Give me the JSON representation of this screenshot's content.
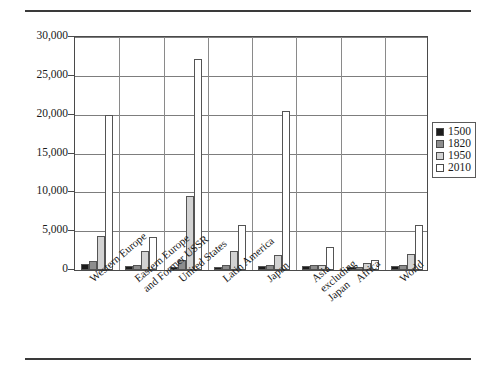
{
  "chart_data": {
    "type": "bar",
    "title": "",
    "subtitle": "",
    "xlabel": "",
    "ylabel": "",
    "ylim": [
      0,
      30000
    ],
    "ytick_labels": [
      "0",
      "5,000",
      "10,000",
      "15,000",
      "20,000",
      "25,000",
      "30,000"
    ],
    "ytick_values": [
      0,
      5000,
      10000,
      15000,
      20000,
      25000,
      30000
    ],
    "grid": "horizontal",
    "legend_position": "right",
    "categories": [
      "Western Europe",
      "Eastern Europe\nand Former USSR",
      "United States",
      "Latin America",
      "Japan",
      "Asia\nexcluding\nJapan",
      "Africa",
      "World"
    ],
    "series": [
      {
        "name": "1500",
        "color": "#1c1c1c",
        "values": [
          800,
          500,
          400,
          400,
          500,
          550,
          400,
          550
        ]
      },
      {
        "name": "1820",
        "color": "#8d8d8d",
        "values": [
          1200,
          700,
          1250,
          700,
          700,
          600,
          450,
          650
        ]
      },
      {
        "name": "1950",
        "color": "#d2d2d2",
        "values": [
          4400,
          2500,
          9500,
          2500,
          1900,
          650,
          900,
          2100
        ]
      },
      {
        "name": "2010",
        "color": "#ffffff",
        "values": [
          20000,
          4300,
          27200,
          5800,
          20500,
          2900,
          1300,
          5800
        ]
      }
    ]
  },
  "legend": {
    "items": [
      {
        "label": "1500"
      },
      {
        "label": "1820"
      },
      {
        "label": "1950"
      },
      {
        "label": "2010"
      }
    ]
  }
}
